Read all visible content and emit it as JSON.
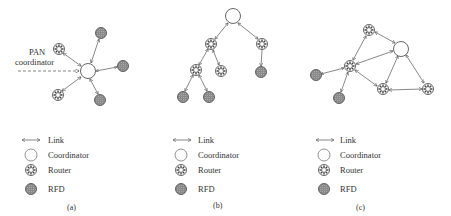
{
  "figure": {
    "panels": [
      {
        "id": "a",
        "caption": "(a)",
        "topology": "star",
        "annotation": {
          "line1": "PAN",
          "line2": "coordinator"
        },
        "legend": {
          "link": "Link",
          "coordinator": "Coordinator",
          "router": "Router",
          "rfd": "RFD"
        }
      },
      {
        "id": "b",
        "caption": "(b)",
        "topology": "tree",
        "legend": {
          "link": "Link",
          "coordinator": "Coordinator",
          "router": "Router",
          "rfd": "RFD"
        }
      },
      {
        "id": "c",
        "caption": "(c)",
        "topology": "mesh",
        "legend": {
          "link": "Link",
          "coordinator": "Coordinator",
          "router": "Router",
          "rfd": "RFD"
        }
      }
    ],
    "colors": {
      "line": "#555555",
      "rfd_fill": "#8a8a8a",
      "router_fill": "#ffffff",
      "coordinator_fill": "#ffffff",
      "text": "#333333"
    }
  }
}
